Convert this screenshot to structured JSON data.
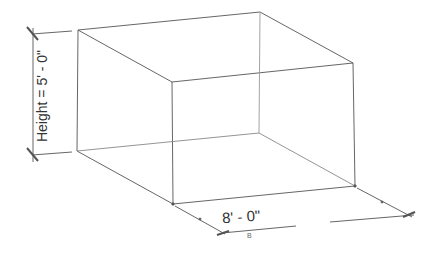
{
  "diagram": {
    "type": "isometric-box",
    "height_label": "Height = 5' - 0\"",
    "width_label": "8' - 0\"",
    "small_mark": "B",
    "line_color": "#555555"
  }
}
